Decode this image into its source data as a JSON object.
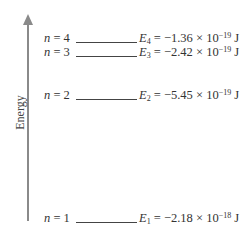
{
  "axis": {
    "label": "Energy"
  },
  "levels": [
    {
      "n_label": "n",
      "n_value": "4",
      "e_symbol": "E",
      "e_sub": "4",
      "e_mantissa": "= −1.36 × 10",
      "e_exp": "−19",
      "e_unit": " J"
    },
    {
      "n_label": "n",
      "n_value": "3",
      "e_symbol": "E",
      "e_sub": "3",
      "e_mantissa": "= −2.42 × 10",
      "e_exp": "−19",
      "e_unit": " J"
    },
    {
      "n_label": "n",
      "n_value": "2",
      "e_symbol": "E",
      "e_sub": "2",
      "e_mantissa": "= −5.45 × 10",
      "e_exp": "−19",
      "e_unit": " J"
    },
    {
      "n_label": "n",
      "n_value": "1",
      "e_symbol": "E",
      "e_sub": "1",
      "e_mantissa": "= −2.18 × 10",
      "e_exp": "−18",
      "e_unit": " J"
    }
  ]
}
